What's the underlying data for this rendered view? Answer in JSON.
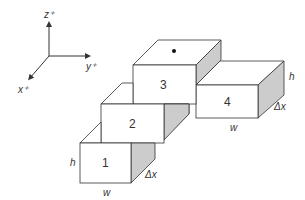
{
  "diagram": {
    "type": "isometric-blocks",
    "axes": {
      "z_label": "z⁺",
      "y_label": "y⁺",
      "x_label": "x⁺"
    },
    "blocks": [
      {
        "id": "1",
        "label": "1"
      },
      {
        "id": "2",
        "label": "2"
      },
      {
        "id": "3",
        "label": "3",
        "marker": "dot"
      },
      {
        "id": "4",
        "label": "4"
      }
    ],
    "dimension_labels": {
      "block1_height": "h",
      "block1_width": "w",
      "block1_depth": "Δx",
      "block4_height": "h",
      "block4_width": "w",
      "block4_depth": "Δx"
    },
    "colors": {
      "face_front": "#ffffff",
      "face_top": "#ffffff",
      "face_side": "#cccccc",
      "stroke": "#333333"
    }
  }
}
